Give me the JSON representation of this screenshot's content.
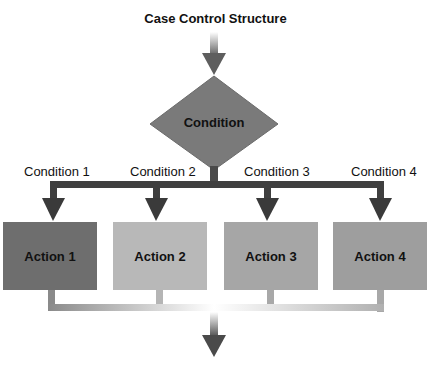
{
  "title": "Case Control Structure",
  "decision": {
    "label": "Condition",
    "color": "#7a7a7a"
  },
  "conditions": [
    {
      "label": "Condition 1"
    },
    {
      "label": "Condition 2"
    },
    {
      "label": "Condition 3"
    },
    {
      "label": "Condition 4"
    }
  ],
  "actions": [
    {
      "label": "Action 1",
      "color": "#6e6e6e"
    },
    {
      "label": "Action 2",
      "color": "#b8b8b8"
    },
    {
      "label": "Action 3",
      "color": "#a6a6a6"
    },
    {
      "label": "Action 4",
      "color": "#9e9e9e"
    }
  ],
  "colors": {
    "arrow_dark": "#3d3d3d",
    "connector_light": "#a0a0a0"
  }
}
